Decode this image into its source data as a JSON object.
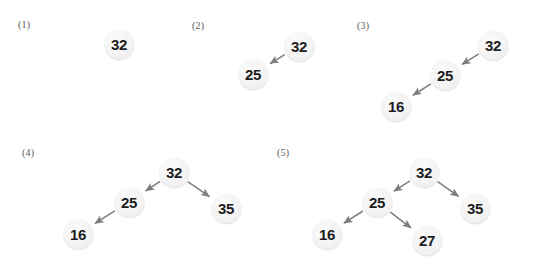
{
  "figure": {
    "width": 533,
    "height": 270,
    "background": "#ffffff",
    "node_fill": "#f2f2f2",
    "node_text_color": "#1d1d1d",
    "edge_color": "#7d7d7d",
    "label_color": "#58585a"
  },
  "chart_data": {
    "type": "diagram",
    "title": "",
    "panels": [
      {
        "label": "(1)",
        "label_x": 18,
        "label_y": 20,
        "nodes": [
          {
            "value": "32",
            "cx": 119,
            "cy": 44
          }
        ],
        "edges": []
      },
      {
        "label": "(2)",
        "label_x": 192,
        "label_y": 21,
        "nodes": [
          {
            "value": "32",
            "cx": 299,
            "cy": 46
          },
          {
            "value": "25",
            "cx": 253,
            "cy": 74
          }
        ],
        "edges": [
          {
            "from": "32",
            "to": "25"
          }
        ]
      },
      {
        "label": "(3)",
        "label_x": 357,
        "label_y": 21,
        "nodes": [
          {
            "value": "32",
            "cx": 493,
            "cy": 45
          },
          {
            "value": "25",
            "cx": 445,
            "cy": 75
          },
          {
            "value": "16",
            "cx": 396,
            "cy": 106
          }
        ],
        "edges": [
          {
            "from": "32",
            "to": "25"
          },
          {
            "from": "25",
            "to": "16"
          }
        ]
      },
      {
        "label": "(4)",
        "label_x": 22,
        "label_y": 148,
        "nodes": [
          {
            "value": "32",
            "cx": 174,
            "cy": 172
          },
          {
            "value": "25",
            "cx": 129,
            "cy": 202
          },
          {
            "value": "35",
            "cx": 226,
            "cy": 208
          },
          {
            "value": "16",
            "cx": 78,
            "cy": 234
          }
        ],
        "edges": [
          {
            "from": "32",
            "to": "25"
          },
          {
            "from": "32",
            "to": "35"
          },
          {
            "from": "25",
            "to": "16"
          }
        ]
      },
      {
        "label": "(5)",
        "label_x": 277,
        "label_y": 148,
        "nodes": [
          {
            "value": "32",
            "cx": 424,
            "cy": 172
          },
          {
            "value": "25",
            "cx": 377,
            "cy": 202
          },
          {
            "value": "35",
            "cx": 475,
            "cy": 208
          },
          {
            "value": "16",
            "cx": 327,
            "cy": 234
          },
          {
            "value": "27",
            "cx": 427,
            "cy": 240
          }
        ],
        "edges": [
          {
            "from": "32",
            "to": "25"
          },
          {
            "from": "32",
            "to": "35"
          },
          {
            "from": "25",
            "to": "16"
          },
          {
            "from": "25",
            "to": "27"
          }
        ]
      }
    ]
  }
}
